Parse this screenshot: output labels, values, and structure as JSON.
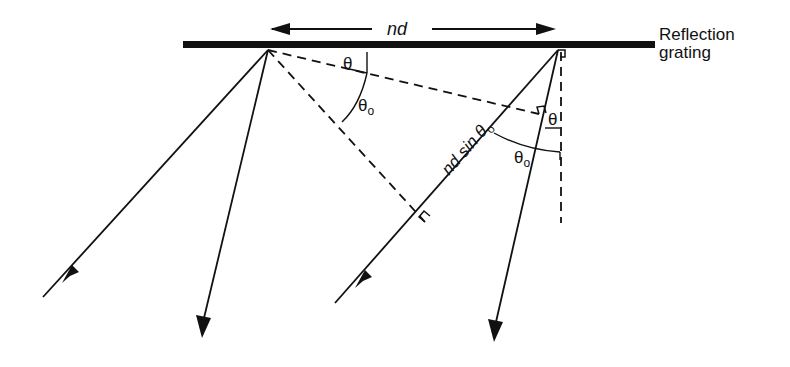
{
  "diagram": {
    "labels": {
      "spacing": "nd",
      "grating_line1": "Reflection",
      "grating_line2": "grating",
      "theta_left": "θ",
      "theta0_left": "θ",
      "theta0_left_sub": "o",
      "path_diff": "nd sin θ",
      "path_diff_sub": "o",
      "theta_right": "θ",
      "theta0_right": "θ",
      "theta0_right_sub": "o"
    },
    "colors": {
      "ink": "#111111",
      "background": "#ffffff"
    }
  }
}
